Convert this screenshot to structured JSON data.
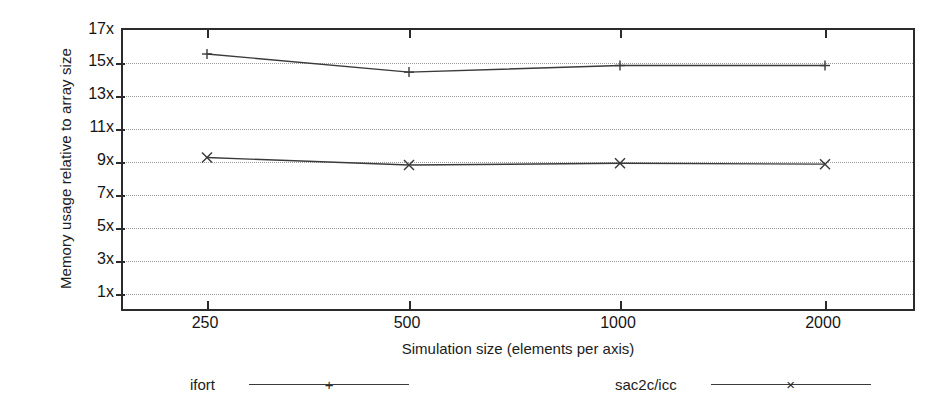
{
  "chart_data": {
    "type": "line",
    "title": "",
    "xlabel": "Simulation size (elements per axis)",
    "ylabel": "Memory usage relative to array size",
    "categories": [
      "250",
      "500",
      "1000",
      "2000"
    ],
    "x_tick_labels": [
      "250",
      "500",
      "1000",
      "2000"
    ],
    "y_tick_labels": [
      "1x",
      "3x",
      "5x",
      "7x",
      "9x",
      "11x",
      "13x",
      "15x",
      "17x"
    ],
    "y_tick_values": [
      1,
      3,
      5,
      7,
      9,
      11,
      13,
      15,
      17
    ],
    "ylim": [
      0,
      17
    ],
    "grid": true,
    "legend_position": "bottom",
    "series": [
      {
        "name": "ifort",
        "marker": "+",
        "color": "#3a3a3a",
        "values": [
          15.6,
          14.5,
          14.9,
          14.9
        ]
      },
      {
        "name": "sac2c/icc",
        "marker": "×",
        "color": "#3a3a3a",
        "values": [
          9.3,
          8.85,
          8.95,
          8.9
        ]
      }
    ]
  },
  "legend": {
    "entries": [
      {
        "label": "ifort",
        "marker": "+"
      },
      {
        "label": "sac2c/icc",
        "marker": "×"
      }
    ]
  }
}
